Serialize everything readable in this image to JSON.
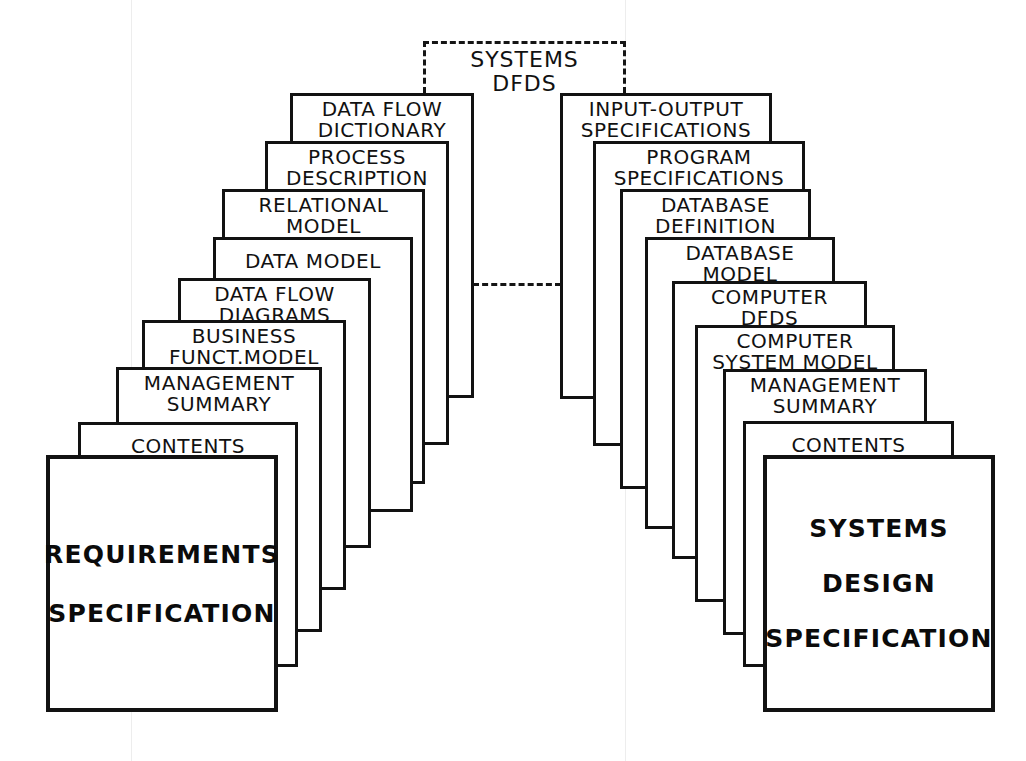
{
  "diagram": {
    "system_box": {
      "label": "SYSTEMS\nDFDS",
      "style": "dashed"
    },
    "left_stack": {
      "cover_title_line1": "REQUIREMENTS",
      "cover_title_line2": "SPECIFICATION",
      "sheets": [
        {
          "label": "DATA FLOW\nDICTIONARY"
        },
        {
          "label": "PROCESS\nDESCRIPTION"
        },
        {
          "label": "RELATIONAL\nMODEL"
        },
        {
          "label": "DATA MODEL"
        },
        {
          "label": "DATA FLOW\nDIAGRAMS"
        },
        {
          "label": "BUSINESS\nFUNCT.MODEL"
        },
        {
          "label": "MANAGEMENT\nSUMMARY"
        },
        {
          "label": "CONTENTS"
        }
      ]
    },
    "right_stack": {
      "cover_title_line1": "SYSTEMS",
      "cover_title_line2": "DESIGN",
      "cover_title_line3": "SPECIFICATION",
      "sheets": [
        {
          "label": "INPUT-OUTPUT\nSPECIFICATIONS"
        },
        {
          "label": "PROGRAM\nSPECIFICATIONS"
        },
        {
          "label": "DATABASE\nDEFINITION"
        },
        {
          "label": "DATABASE\nMODEL"
        },
        {
          "label": "COMPUTER\nDFDS"
        },
        {
          "label": "COMPUTER\nSYSTEM MODEL"
        },
        {
          "label": "MANAGEMENT\nSUMMARY"
        },
        {
          "label": "CONTENTS"
        }
      ]
    },
    "colors": {
      "ink": "#121212",
      "paper": "#ffffff"
    }
  }
}
